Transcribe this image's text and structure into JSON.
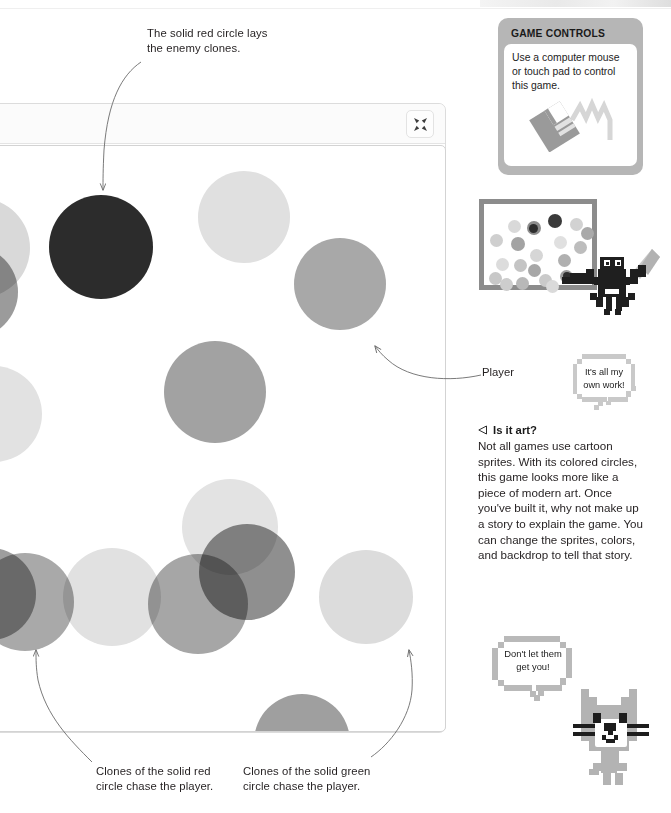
{
  "page": {
    "background": "#ffffff",
    "width": 671,
    "height": 813
  },
  "game_window": {
    "name": "scratch-stage-window",
    "fullscreen_button": {
      "icon": "shrink-fullscreen-icon",
      "label": ""
    },
    "stage": {
      "background": "#ffffff",
      "note": "Colored semi-transparent circle sprites rendered in greyscale"
    }
  },
  "callouts": [
    {
      "id": "red-circle-callout",
      "text": "The solid red circle lays\nthe enemy clones.",
      "line1": "The solid red circle lays",
      "line2": "the enemy clones.",
      "x": 147,
      "y": 26,
      "align": "left"
    },
    {
      "id": "player-callout",
      "text": "Player",
      "line1": "Player",
      "line2": "",
      "x": 482,
      "y": 366,
      "align": "left"
    },
    {
      "id": "red-clones-callout",
      "text": "Clones of the solid red\ncircle chase the player.",
      "line1": "Clones of the solid red",
      "line2": "circle chase the player.",
      "x": 96,
      "y": 765,
      "align": "left"
    },
    {
      "id": "green-clones-callout",
      "text": "Clones of the solid green\ncircle chase the player.",
      "line1": "Clones of the solid green",
      "line2": "circle chase the player.",
      "x": 243,
      "y": 765,
      "align": "left"
    }
  ],
  "controls_panel": {
    "title": "GAME CONTROLS",
    "body_line1": "Use a computer mouse",
    "body_line2": "or touch pad to control",
    "body_line3": "this game.",
    "body_text": "Use a computer mouse or touch pad to control this game.",
    "icon": "computer-mouse-icon",
    "frame_color": "#b6b6b6"
  },
  "sidebar": {
    "thumbnail_caption": "",
    "bat_speech": {
      "line1": "It's all my",
      "line2": "own work!",
      "text": "It's all my own work!"
    },
    "cat_speech": {
      "line1": "Don't let them",
      "line2": "get you!",
      "text": "Don't let them get you!"
    },
    "art_section": {
      "heading": "Is it art?",
      "heading_marker": "triangle-left-icon",
      "body": "Not all games use cartoon sprites. With its colored circles, this game looks more like a piece of modern art. Once you've built it, why not make up a story to explain the game. You can change the sprites, colors, and backdrop to tell that story."
    }
  },
  "chart_data": {
    "type": "scatter",
    "xlabel": "",
    "ylabel": "",
    "sprites": [
      {
        "id": "s1",
        "cx": -22,
        "cy": 246,
        "r": 50,
        "color": "#d9d9d9",
        "opacity": 1,
        "label": "pale clone (off-left)"
      },
      {
        "id": "s2",
        "cx": -30,
        "cy": 290,
        "r": 46,
        "color": "#9b9b9b",
        "opacity": 1,
        "label": "grey clone (off-left)"
      },
      {
        "id": "s3",
        "cx": 99,
        "cy": 245,
        "r": 52,
        "color": "#2c2c2c",
        "opacity": 1,
        "label": "solid red circle (dark)"
      },
      {
        "id": "s4",
        "cx": 242,
        "cy": 215,
        "r": 46,
        "color": "#e0e0e0",
        "opacity": 1,
        "label": "pale clone"
      },
      {
        "id": "s5",
        "cx": 338,
        "cy": 282,
        "r": 46,
        "color": "#a8a8a8",
        "opacity": 1,
        "label": "player (mid grey)"
      },
      {
        "id": "s6",
        "cx": -8,
        "cy": 412,
        "r": 48,
        "color": "#e2e2e2",
        "opacity": 1,
        "label": "pale clone (off-left)"
      },
      {
        "id": "s7",
        "cx": 213,
        "cy": 390,
        "r": 51,
        "color": "#a2a2a2",
        "opacity": 1,
        "label": "grey clone"
      },
      {
        "id": "s8",
        "cx": 228,
        "cy": 525,
        "r": 48,
        "color": "#e3e3e3",
        "opacity": 1,
        "label": "pale clone"
      },
      {
        "id": "s9",
        "cx": 245,
        "cy": 570,
        "r": 48,
        "color": "#8f8f8f",
        "opacity": 1,
        "label": "dark grey clone"
      },
      {
        "id": "s10",
        "cx": 196,
        "cy": 602,
        "r": 50,
        "color": "#a6a6a6",
        "opacity": 1,
        "label": "grey clone"
      },
      {
        "id": "s11",
        "cx": 110,
        "cy": 595,
        "r": 49,
        "color": "#e1e1e1",
        "opacity": 1,
        "label": "pale clone"
      },
      {
        "id": "s12",
        "cx": 23,
        "cy": 600,
        "r": 49,
        "color": "#a9a9a9",
        "opacity": 1,
        "label": "grey clone"
      },
      {
        "id": "s13",
        "cx": -12,
        "cy": 592,
        "r": 46,
        "color": "#9e9e9e",
        "opacity": 1,
        "label": "grey clone (off-left)"
      },
      {
        "id": "s14",
        "cx": 364,
        "cy": 595,
        "r": 47,
        "color": "#dcdcdc",
        "opacity": 1,
        "label": "pale clone"
      },
      {
        "id": "s15",
        "cx": 300,
        "cy": 740,
        "r": 48,
        "color": "#9f9f9f",
        "opacity": 1,
        "label": "grey clone (bottom)"
      }
    ]
  }
}
